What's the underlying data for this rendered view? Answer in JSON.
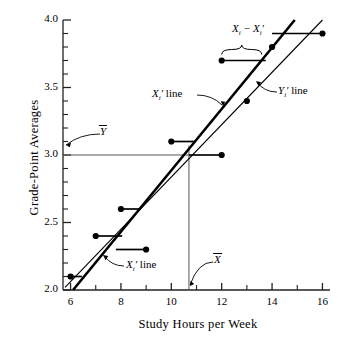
{
  "chart_data": {
    "type": "scatter",
    "title": "",
    "xlabel": "Study Hours per Week",
    "ylabel": "Grade-Point Averages",
    "xlim": [
      5.7,
      16.3
    ],
    "ylim": [
      2.0,
      4.0
    ],
    "xticks": [
      6,
      8,
      10,
      12,
      14,
      16
    ],
    "xtick_labels": [
      "6",
      "8",
      "10",
      "12",
      "14",
      "16"
    ],
    "xminor_ticks": [
      7,
      9,
      11,
      13,
      15
    ],
    "yticks": [
      2.0,
      2.5,
      3.0,
      3.5,
      4.0
    ],
    "ytick_labels": [
      "2.0",
      "2.5",
      "3.0",
      "3.5",
      "4.0"
    ],
    "yminor_ticks": [
      2.1,
      2.2,
      2.3,
      2.4,
      2.6,
      2.7,
      2.8,
      2.9,
      3.1,
      3.2,
      3.3,
      3.4,
      3.6,
      3.7,
      3.8,
      3.9
    ],
    "grid": false,
    "legend": "none",
    "points": [
      {
        "x": 6,
        "y": 2.1
      },
      {
        "x": 7,
        "y": 2.4
      },
      {
        "x": 8,
        "y": 2.6
      },
      {
        "x": 9,
        "y": 2.3
      },
      {
        "x": 10,
        "y": 3.1
      },
      {
        "x": 12,
        "y": 3.0
      },
      {
        "x": 12,
        "y": 3.7
      },
      {
        "x": 13,
        "y": 3.4
      },
      {
        "x": 14,
        "y": 3.8
      },
      {
        "x": 16,
        "y": 3.9
      }
    ],
    "residual_segments": [
      {
        "x1": 6,
        "x2": 6.45,
        "y": 2.1
      },
      {
        "x1": 7,
        "x2": 8.05,
        "y": 2.4
      },
      {
        "x1": 8,
        "x2": 8.75,
        "y": 2.6
      },
      {
        "x1": 7.8,
        "x2": 9,
        "y": 2.3
      },
      {
        "x1": 10,
        "x2": 10.95,
        "y": 3.1
      },
      {
        "x1": 10.7,
        "x2": 12,
        "y": 3.0
      },
      {
        "x1": 12,
        "x2": 13.75,
        "y": 3.7
      },
      {
        "x1": 12.9,
        "x2": 13,
        "y": 3.4
      },
      {
        "x1": 14,
        "x2": 15.9,
        "y": 3.9
      }
    ],
    "series": [
      {
        "name": "X_i' line",
        "type": "line",
        "thick": true,
        "x1": 6.1,
        "y1": 2.0,
        "x2": 14.9,
        "y2": 4.0
      },
      {
        "name": "Y_i' line",
        "type": "line",
        "thick": false,
        "x1": 5.78,
        "y1": 2.02,
        "x2": 16.0,
        "y2": 4.0
      }
    ],
    "mean_lines": {
      "x_mean": 10.7,
      "y_mean": 3.0,
      "x_mean_label": "X",
      "y_mean_label": "Y"
    },
    "annotations": [
      {
        "name": "x-bar",
        "text": "X",
        "overbar": true
      },
      {
        "name": "y-bar",
        "text": "Y",
        "overbar": true
      },
      {
        "name": "xi-line",
        "text": "X",
        "sub": "i",
        "prime": "′",
        "suffix": " line"
      },
      {
        "name": "xi-line-lower",
        "text": "X",
        "sub": "i",
        "prime": "′",
        "suffix": " line"
      },
      {
        "name": "yi-line",
        "text": "Y",
        "sub": "i",
        "prime": "′",
        "suffix": " line"
      },
      {
        "name": "residual-brace",
        "text": "X",
        "sub": "i",
        "minus": " − ",
        "text2": "X",
        "sub2": "i",
        "prime2": "′"
      }
    ]
  },
  "labels": {
    "xaxis_title": "Study Hours per Week",
    "yaxis_title": "Grade-Point Averages",
    "xbar": "X",
    "ybar": "Y",
    "xi_line": " line",
    "yi_line": " line",
    "i": "i",
    "prime": "′",
    "minus": "−",
    "X": "X",
    "Y": "Y"
  }
}
